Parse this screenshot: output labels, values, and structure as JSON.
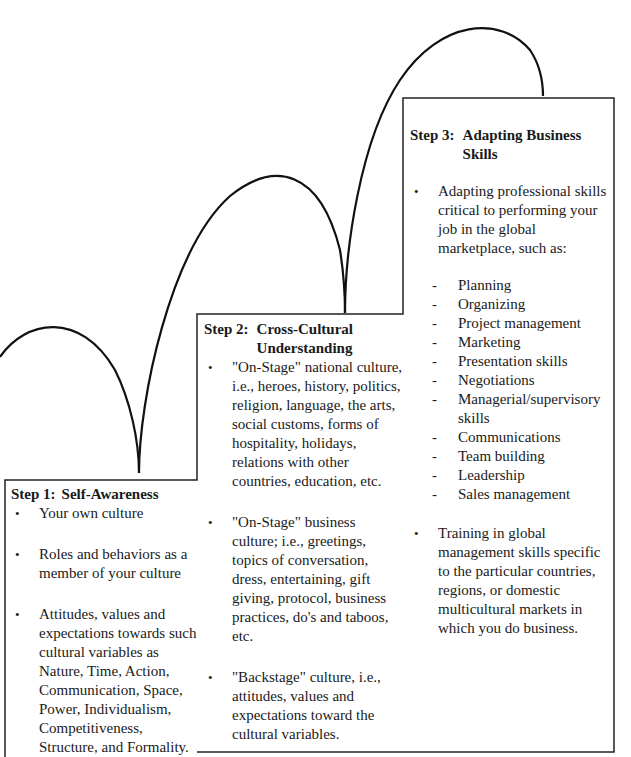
{
  "diagram": {
    "type": "staircase",
    "steps": [
      {
        "id": "step1",
        "number_label": "Step 1:",
        "title": "Self-Awareness",
        "bullets": [
          {
            "text": "Your own culture"
          },
          {
            "text": "Roles and behaviors as a member of your culture"
          },
          {
            "text": "Attitudes, values and expectations towards such cultural variables as Nature, Time, Action, Communication, Space, Power, Individualism, Competitiveness, Structure, and Formality."
          }
        ]
      },
      {
        "id": "step2",
        "number_label": "Step 2:",
        "title": "Cross-Cultural Understanding",
        "bullets": [
          {
            "text": "\"On-Stage\" national culture, i.e., heroes, history, politics, religion, language, the arts, social customs, forms of hospitality, holidays, relations with other countries, education, etc."
          },
          {
            "text": "\"On-Stage\" business culture; i.e., greetings, topics of conversation, dress, entertaining, gift giving, protocol, business practices, do's and taboos, etc."
          },
          {
            "text": "\"Backstage\" culture, i.e., attitudes, values and expectations toward the cultural variables."
          }
        ]
      },
      {
        "id": "step3",
        "number_label": "Step 3:",
        "title": "Adapting Business Skills",
        "bullets": [
          {
            "text": "Adapting professional skills critical to performing your job in the global marketplace, such as:",
            "sub_items": [
              "Planning",
              "Organizing",
              "Project management",
              "Marketing",
              "Presentation skills",
              "Negotiations",
              "Managerial/supervisory skills",
              "Communications",
              "Team building",
              "Leadership",
              "Sales management"
            ]
          },
          {
            "text": "Training in global management skills specific to the particular countries, regions, or domestic multicultural markets in which you do business."
          }
        ]
      }
    ],
    "colors": {
      "line": "#111111",
      "background": "#ffffff",
      "text": "#1a1a1a"
    }
  }
}
